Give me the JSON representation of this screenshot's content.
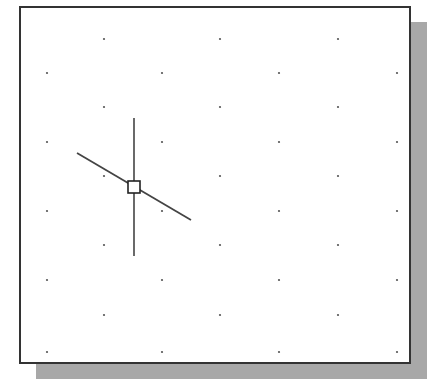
{
  "viewport": {
    "frame": {
      "x": 19,
      "y": 6,
      "width": 392,
      "height": 358,
      "border_color": "#333333"
    },
    "shadow": {
      "offset": 16,
      "color": "#a8a8a8"
    },
    "background": "#ffffff"
  },
  "grid": {
    "dot_color": "#555555",
    "rows_y": [
      39,
      73,
      107,
      142,
      176,
      211,
      245,
      280,
      315,
      352
    ],
    "odd_cols_x": [
      104,
      220,
      338
    ],
    "even_cols_x": [
      47,
      162,
      279,
      397
    ]
  },
  "cursor": {
    "type": "crosshair-pickbox",
    "center": {
      "x": 134,
      "y": 187
    },
    "pickbox_size": 12,
    "vertical_line": {
      "y1": 118,
      "y2": 256
    },
    "rubber_band_line": {
      "x1": 77,
      "y1": 153,
      "x2": 191,
      "y2": 220
    },
    "color": "#444444"
  }
}
